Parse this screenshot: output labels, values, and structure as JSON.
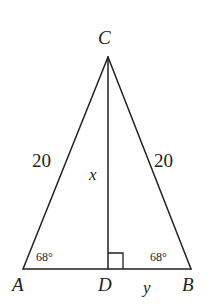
{
  "figure": {
    "type": "isosceles-triangle-with-altitude",
    "stroke_color": "#231f20",
    "background_color": "#ffffff",
    "vertices": {
      "A": {
        "label": "A",
        "x": 23,
        "y": 269
      },
      "B": {
        "label": "B",
        "x": 191,
        "y": 269
      },
      "C": {
        "label": "C",
        "x": 108,
        "y": 57
      },
      "D": {
        "label": "D",
        "x": 108,
        "y": 269
      }
    },
    "side_labels": {
      "left": "20",
      "right": "20"
    },
    "segment_labels": {
      "altitude": "x",
      "base_right": "y"
    },
    "angle_labels": {
      "at_A": "68°",
      "at_B": "68°"
    },
    "right_angle_marker": {
      "present": true,
      "at_vertex": "D",
      "side": "right",
      "size": 15
    }
  }
}
